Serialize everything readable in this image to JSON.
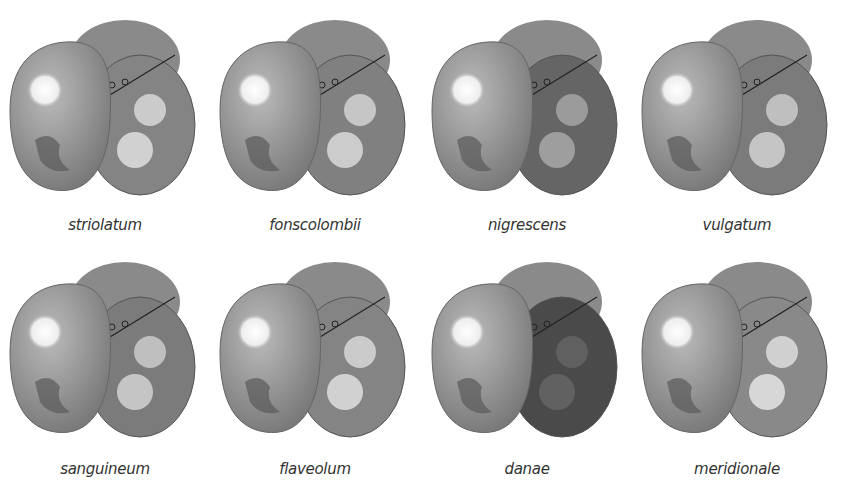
{
  "plate": {
    "subject": "dragonfly heads (frontal view)",
    "rows": [
      {
        "items": [
          {
            "caption": "striolatum",
            "frons": "pale",
            "dark": 0.2
          },
          {
            "caption": "fonscolombii",
            "frons": "pale-spotted",
            "dark": 0.25
          },
          {
            "caption": "nigrescens",
            "frons": "pale-dark-band",
            "dark": 0.55
          },
          {
            "caption": "vulgatum",
            "frons": "pale",
            "dark": 0.3
          }
        ]
      },
      {
        "items": [
          {
            "caption": "sanguineum",
            "frons": "pale",
            "dark": 0.3
          },
          {
            "caption": "flaveolum",
            "frons": "pale",
            "dark": 0.2
          },
          {
            "caption": "danae",
            "frons": "dark",
            "dark": 0.85
          },
          {
            "caption": "meridionale",
            "frons": "pale-spotted",
            "dark": 0.15
          }
        ]
      }
    ]
  }
}
